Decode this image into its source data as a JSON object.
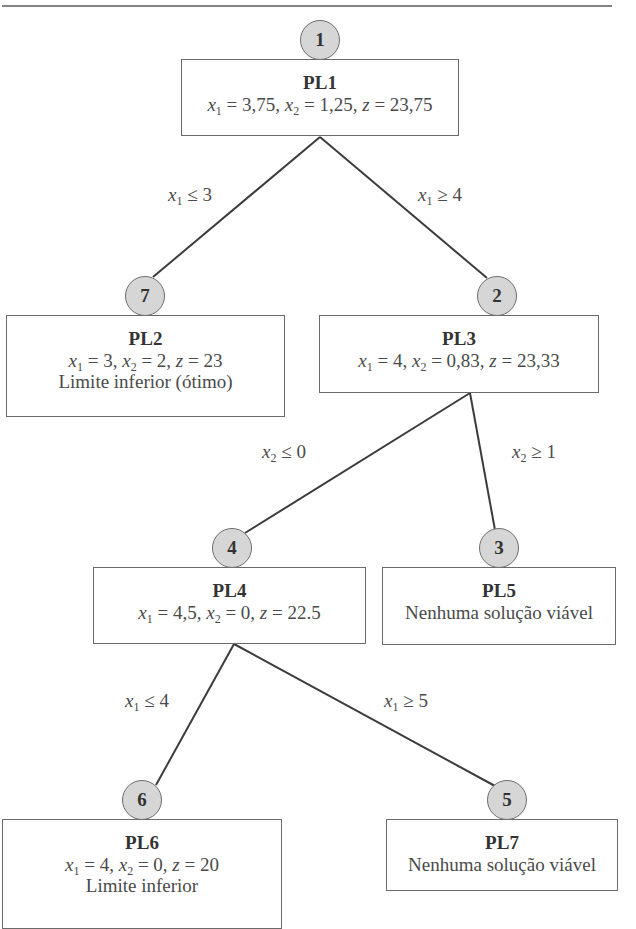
{
  "diagram": {
    "type": "branch-and-bound-tree",
    "nodes": [
      {
        "id": "PL1",
        "order": "1",
        "title": "PL1",
        "values": {
          "x1": "3,75",
          "x2": "1,25",
          "z": "23,75"
        },
        "note": ""
      },
      {
        "id": "PL2",
        "order": "7",
        "title": "PL2",
        "values": {
          "x1": "3",
          "x2": "2",
          "z": "23"
        },
        "note": "Limite inferior (ótimo)"
      },
      {
        "id": "PL3",
        "order": "2",
        "title": "PL3",
        "values": {
          "x1": "4",
          "x2": "0,83",
          "z": "23,33"
        },
        "note": ""
      },
      {
        "id": "PL4",
        "order": "4",
        "title": "PL4",
        "values": {
          "x1": "4,5",
          "x2": "0",
          "z": "22.5"
        },
        "note": ""
      },
      {
        "id": "PL5",
        "order": "3",
        "title": "PL5",
        "values": null,
        "note": "Nenhuma solução viável"
      },
      {
        "id": "PL6",
        "order": "6",
        "title": "PL6",
        "values": {
          "x1": "4",
          "x2": "0",
          "z": "20"
        },
        "note": "Limite inferior"
      },
      {
        "id": "PL7",
        "order": "5",
        "title": "PL7",
        "values": null,
        "note": "Nenhuma solução viável"
      }
    ],
    "edges": [
      {
        "from": "PL1",
        "to": "PL2",
        "var": "x",
        "sub": "1",
        "op": "≤",
        "rhs": "3"
      },
      {
        "from": "PL1",
        "to": "PL3",
        "var": "x",
        "sub": "1",
        "op": "≥",
        "rhs": "4"
      },
      {
        "from": "PL3",
        "to": "PL4",
        "var": "x",
        "sub": "2",
        "op": "≤",
        "rhs": "0"
      },
      {
        "from": "PL3",
        "to": "PL5",
        "var": "x",
        "sub": "2",
        "op": "≥",
        "rhs": "1"
      },
      {
        "from": "PL4",
        "to": "PL6",
        "var": "x",
        "sub": "1",
        "op": "≤",
        "rhs": "4"
      },
      {
        "from": "PL4",
        "to": "PL7",
        "var": "x",
        "sub": "1",
        "op": "≥",
        "rhs": "5"
      }
    ]
  },
  "labels": {
    "eq": " = ",
    "comma": ", ",
    "z": "z",
    "x": "x",
    "sub1": "1",
    "sub2": "2"
  },
  "colors": {
    "node_fill": "#d6d6d6",
    "node_border": "#6e6e6e",
    "edge": "#3c3c3c",
    "box_border": "#6a6a6a"
  }
}
